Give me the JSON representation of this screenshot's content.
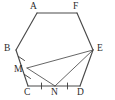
{
  "figure": {
    "type": "geometry-diagram",
    "canvas": {
      "width": 115,
      "height": 100,
      "background": "#ffffff"
    },
    "stroke_color": "#4a4a4a",
    "label_color": "#2b2b2b"
  },
  "labels": {
    "A": "A",
    "B": "B",
    "C": "C",
    "D": "D",
    "E": "E",
    "F": "F",
    "M": "M",
    "N": "N"
  },
  "points": {
    "A": {
      "x": 37,
      "y": 13
    },
    "F": {
      "x": 77,
      "y": 13
    },
    "B": {
      "x": 16,
      "y": 50
    },
    "E": {
      "x": 93,
      "y": 50
    },
    "C": {
      "x": 28,
      "y": 86
    },
    "D": {
      "x": 80,
      "y": 86
    },
    "M": {
      "x": 27,
      "y": 68
    },
    "N": {
      "x": 55,
      "y": 86
    }
  },
  "label_positions": {
    "A": {
      "x": 30,
      "y": 2
    },
    "F": {
      "x": 73,
      "y": 2
    },
    "B": {
      "x": 4,
      "y": 44
    },
    "E": {
      "x": 97,
      "y": 44
    },
    "C": {
      "x": 24,
      "y": 88
    },
    "D": {
      "x": 77,
      "y": 88
    },
    "M": {
      "x": 14,
      "y": 65
    },
    "N": {
      "x": 51,
      "y": 88
    }
  },
  "edges": [
    {
      "name": "A-F",
      "from": "A",
      "to": "F",
      "kind": "polygon"
    },
    {
      "name": "F-E",
      "from": "F",
      "to": "E",
      "kind": "polygon"
    },
    {
      "name": "E-D",
      "from": "E",
      "to": "D",
      "kind": "polygon"
    },
    {
      "name": "D-C",
      "from": "D",
      "to": "C",
      "kind": "polygon"
    },
    {
      "name": "C-B",
      "from": "C",
      "to": "B",
      "kind": "polygon"
    },
    {
      "name": "B-A",
      "from": "B",
      "to": "A",
      "kind": "polygon"
    }
  ],
  "inner_segments": [
    {
      "name": "M-E",
      "from": "M",
      "to": "E"
    },
    {
      "name": "M-N",
      "from": "M",
      "to": "N"
    },
    {
      "name": "N-E",
      "from": "N",
      "to": "E"
    }
  ],
  "congruence_marks": [
    {
      "name": "tick-BM",
      "segment": "B-M",
      "count": 1
    },
    {
      "name": "tick-MC",
      "segment": "M-C",
      "count": 1
    },
    {
      "name": "tick-CN",
      "segment": "C-N",
      "count": 1
    },
    {
      "name": "tick-ND",
      "segment": "N-D",
      "count": 1
    }
  ]
}
